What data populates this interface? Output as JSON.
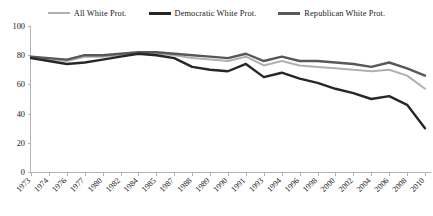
{
  "chart_data": {
    "type": "line",
    "title": "",
    "subtitle": "",
    "xlabel": "",
    "ylabel": "",
    "ylim": [
      0,
      100
    ],
    "yticks": [
      0,
      20,
      40,
      60,
      80,
      100
    ],
    "grid": false,
    "legend_position": "top-center",
    "categories": [
      "1973",
      "1974",
      "1976",
      "1977",
      "1980",
      "1982",
      "1984",
      "1985",
      "1987",
      "1988",
      "1989",
      "1990",
      "1991",
      "1993",
      "1994",
      "1996",
      "1998",
      "2000",
      "2002",
      "2004",
      "2006",
      "2008",
      "2010"
    ],
    "series": [
      {
        "name": "All White Prot.",
        "color": "#b0b0b0",
        "width": 2,
        "values": [
          79,
          77,
          76,
          79,
          79,
          80,
          81,
          81,
          80,
          78,
          77,
          76,
          79,
          73,
          76,
          73,
          72,
          71,
          70,
          69,
          70,
          66,
          57
        ]
      },
      {
        "name": "Democratic White Prot.",
        "color": "#262626",
        "width": 2.4,
        "values": [
          78,
          76,
          74,
          75,
          77,
          79,
          81,
          80,
          78,
          72,
          70,
          69,
          74,
          65,
          68,
          64,
          61,
          57,
          54,
          50,
          52,
          46,
          30
        ]
      },
      {
        "name": "Republican White Prot.",
        "color": "#585858",
        "width": 2.4,
        "values": [
          79,
          78,
          77,
          80,
          80,
          81,
          82,
          82,
          81,
          80,
          79,
          78,
          81,
          76,
          79,
          76,
          76,
          75,
          74,
          72,
          75,
          71,
          66
        ]
      }
    ]
  },
  "legend": {
    "items": [
      {
        "label": "All White Prot."
      },
      {
        "label": "Democratic White Prot."
      },
      {
        "label": "Republican White Prot."
      }
    ]
  },
  "axes": {
    "y_labels": [
      "100",
      "80",
      "60",
      "40",
      "20",
      "0"
    ],
    "x_labels": [
      "1973",
      "1974",
      "1976",
      "1977",
      "1980",
      "1982",
      "1984",
      "1985",
      "1987",
      "1988",
      "1989",
      "1990",
      "1991",
      "1993",
      "1994",
      "1996",
      "1998",
      "2000",
      "2002",
      "2004",
      "2006",
      "2008",
      "2010"
    ]
  }
}
